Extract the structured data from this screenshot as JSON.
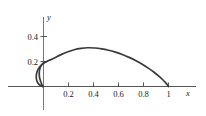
{
  "figure": {
    "axis_color": "#555555",
    "curve_color": "#3a3a3a",
    "background": "#ffffff",
    "x_axis_name": "x",
    "y_axis_name": "y"
  },
  "chart_data": {
    "type": "line",
    "title": "",
    "xlabel": "x",
    "ylabel": "y",
    "grid": false,
    "legend": null,
    "xlim": [
      -0.12,
      1.22
    ],
    "ylim": [
      -0.07,
      0.52
    ],
    "xticks": [
      0.2,
      0.4,
      0.6,
      0.8,
      1
    ],
    "xtick_labels": [
      "0.2",
      "0.4",
      "0.6",
      "0.8",
      "1"
    ],
    "yticks": [
      0.2,
      0.4
    ],
    "ytick_labels": [
      "0.2",
      "0.4"
    ],
    "series": [
      {
        "name": "curve",
        "comment": "closed loop curve: small loop left of y-axis, arch peaking near (0.35, 0.31), ending at (1, 0)",
        "points": [
          [
            -0.005,
            0.0
          ],
          [
            -0.03,
            0.012
          ],
          [
            -0.048,
            0.034
          ],
          [
            -0.057,
            0.062
          ],
          [
            -0.057,
            0.095
          ],
          [
            -0.048,
            0.128
          ],
          [
            -0.03,
            0.158
          ],
          [
            -0.006,
            0.181
          ],
          [
            0.022,
            0.198
          ],
          [
            0.055,
            0.213
          ],
          [
            0.095,
            0.232
          ],
          [
            0.14,
            0.255
          ],
          [
            0.19,
            0.276
          ],
          [
            0.245,
            0.294
          ],
          [
            0.3,
            0.305
          ],
          [
            0.355,
            0.31
          ],
          [
            0.41,
            0.308
          ],
          [
            0.465,
            0.301
          ],
          [
            0.52,
            0.29
          ],
          [
            0.575,
            0.275
          ],
          [
            0.63,
            0.256
          ],
          [
            0.685,
            0.233
          ],
          [
            0.74,
            0.206
          ],
          [
            0.79,
            0.178
          ],
          [
            0.838,
            0.147
          ],
          [
            0.882,
            0.116
          ],
          [
            0.92,
            0.085
          ],
          [
            0.952,
            0.056
          ],
          [
            0.976,
            0.031
          ],
          [
            0.992,
            0.012
          ],
          [
            1.0,
            0.0
          ]
        ]
      }
    ],
    "loop_tail": {
      "comment": "lower branch of the loop returning from the y-axis crossing down to the x-axis near x = -0.005",
      "points": [
        [
          0.022,
          0.198
        ],
        [
          0.0,
          0.188
        ],
        [
          -0.018,
          0.168
        ],
        [
          -0.03,
          0.14
        ],
        [
          -0.034,
          0.108
        ],
        [
          -0.032,
          0.074
        ],
        [
          -0.024,
          0.044
        ],
        [
          -0.014,
          0.018
        ],
        [
          -0.005,
          0.0
        ]
      ]
    }
  }
}
